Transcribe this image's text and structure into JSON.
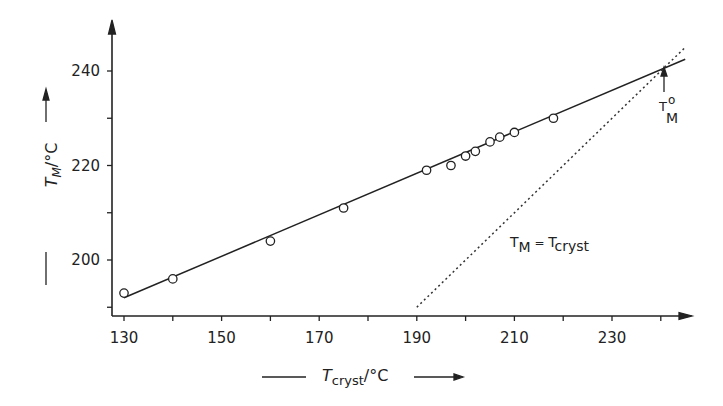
{
  "chart_data": {
    "type": "scatter",
    "title": "",
    "xlabel": "T_cryst / °C",
    "ylabel": "T_M / °C",
    "xlim": [
      127,
      247
    ],
    "ylim": [
      187,
      248
    ],
    "x_ticks": [
      130,
      140,
      150,
      160,
      170,
      180,
      190,
      200,
      210,
      220,
      230,
      240
    ],
    "x_tick_labels": [
      "130",
      "150",
      "170",
      "190",
      "210",
      "230"
    ],
    "y_ticks": [
      190,
      200,
      210,
      220,
      230,
      240
    ],
    "y_tick_labels": [
      "200",
      "220",
      "240"
    ],
    "grid": false,
    "series": [
      {
        "name": "measured T_M",
        "style": "open-circle",
        "x": [
          130,
          140,
          160,
          175,
          192,
          197,
          200,
          202,
          205,
          207,
          210,
          218
        ],
        "y": [
          193,
          196,
          204,
          211,
          219,
          220,
          222,
          223,
          225,
          226,
          227,
          230
        ]
      },
      {
        "name": "linear fit",
        "style": "solid-line",
        "x": [
          130,
          245
        ],
        "y": [
          192,
          242.5
        ]
      },
      {
        "name": "T_M = T_cryst",
        "style": "dotted-line",
        "x": [
          190,
          245
        ],
        "y": [
          190,
          245
        ]
      }
    ],
    "annotations": [
      {
        "text": "T_M = T_cryst",
        "x": 208,
        "y": 204
      },
      {
        "text": "T°_M",
        "x": 240.5,
        "y": 241,
        "arrow": true
      }
    ]
  },
  "labels": {
    "y_axis_T": "T",
    "y_axis_sub": "M",
    "y_axis_unit": "/°C",
    "x_axis_T": "T",
    "x_axis_sub": "cryst",
    "x_axis_unit": "/°C",
    "eq_T1": "T",
    "eq_sub1": "M",
    "eq_equals": " = ",
    "eq_T2": "T",
    "eq_sub2": "cryst",
    "tm0_T": "T",
    "tm0_sup": "o",
    "tm0_sub": "M"
  }
}
